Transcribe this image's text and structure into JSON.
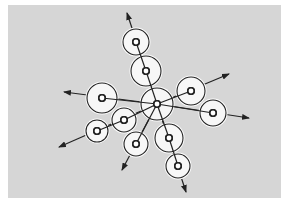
{
  "diagram": {
    "type": "radial-node-diagram",
    "background_color": "#d6d6d6",
    "line_color": "#222222",
    "center": {
      "x": 157,
      "y": 104,
      "r": 16
    },
    "branches": [
      {
        "name": "top",
        "nodes": [
          {
            "x": 146,
            "y": 71,
            "r": 15
          },
          {
            "x": 136,
            "y": 42,
            "r": 13
          }
        ],
        "arrow_to": {
          "x": 127,
          "y": 13
        }
      },
      {
        "name": "upper-right",
        "nodes": [
          {
            "x": 191,
            "y": 91,
            "r": 14
          }
        ],
        "arrow_to": {
          "x": 229,
          "y": 74
        }
      },
      {
        "name": "right",
        "nodes": [
          {
            "x": 213,
            "y": 113,
            "r": 13
          }
        ],
        "arrow_to": {
          "x": 249,
          "y": 118
        }
      },
      {
        "name": "left",
        "nodes": [
          {
            "x": 102,
            "y": 98,
            "r": 15
          }
        ],
        "arrow_to": {
          "x": 64,
          "y": 92
        }
      },
      {
        "name": "lower-left",
        "nodes": [
          {
            "x": 124,
            "y": 120,
            "r": 12
          },
          {
            "x": 97,
            "y": 131,
            "r": 11
          }
        ],
        "arrow_to": {
          "x": 59,
          "y": 147
        }
      },
      {
        "name": "lower",
        "nodes": [
          {
            "x": 136,
            "y": 144,
            "r": 12
          }
        ],
        "arrow_to": {
          "x": 122,
          "y": 170
        }
      },
      {
        "name": "lower-right",
        "nodes": [
          {
            "x": 169,
            "y": 138,
            "r": 14
          },
          {
            "x": 178,
            "y": 166,
            "r": 12
          }
        ],
        "arrow_to": {
          "x": 186,
          "y": 192
        }
      }
    ]
  }
}
